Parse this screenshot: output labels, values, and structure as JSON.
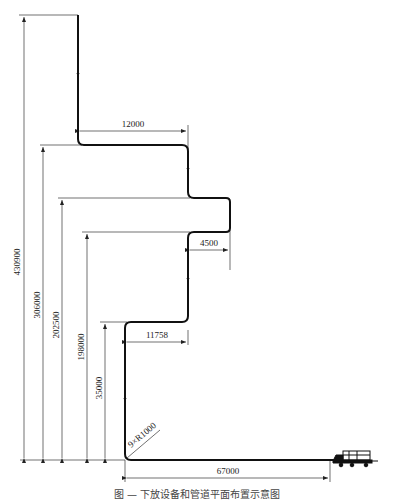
{
  "diagram": {
    "type": "pipeline-elevation-schematic",
    "dimensions": {
      "vertical": [
        {
          "label": "430900",
          "meaning": "total height"
        },
        {
          "label": "306000",
          "meaning": "height to first horizontal offset"
        },
        {
          "label": "202500",
          "meaning": "height to upper edge of loop"
        },
        {
          "label": "198000",
          "meaning": "height to lower edge of loop"
        },
        {
          "label": "35000",
          "meaning": "height to lower horizontal offset"
        }
      ],
      "horizontal": [
        {
          "label": "12000",
          "meaning": "upper horizontal offset"
        },
        {
          "label": "4500",
          "meaning": "loop protrusion"
        },
        {
          "label": "11758",
          "meaning": "lower horizontal offset"
        },
        {
          "label": "67000",
          "meaning": "ground run length"
        }
      ],
      "bend_note": "9×R1000"
    },
    "equipment": {
      "name": "vehicle/trolley",
      "icon": "truck-icon"
    },
    "caption": "图 — 下放设备和管道平面布置示意图"
  }
}
